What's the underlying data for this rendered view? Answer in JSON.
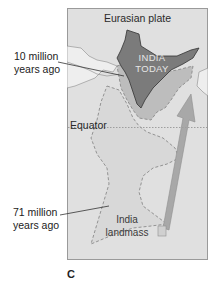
{
  "map": {
    "title": "Eurasian plate",
    "india_today_line1": "INDIA",
    "india_today_line2": "TODAY",
    "equator_label": "Equator",
    "landmass_line1": "India",
    "landmass_line2": "landmass",
    "colors": {
      "background": "#e0e0e0",
      "frame_border": "#9a9a9a",
      "india_today": "#7b7b7b",
      "position_10my": "#bdbdbd",
      "landmass_71my": "#d8d8d8",
      "arrow": "#a8a8a8",
      "neighbor_land": "#eeeeee"
    }
  },
  "annotations": {
    "ten_my_line1": "10 million",
    "ten_my_line2": "years ago",
    "seventy_one_my_line1": "71 million",
    "seventy_one_my_line2": "years ago"
  },
  "panel_label": "C"
}
